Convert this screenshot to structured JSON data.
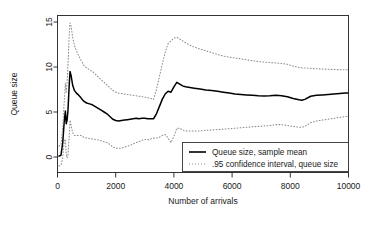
{
  "chart_data": {
    "type": "line",
    "title": "",
    "xlabel": "Number of arrivals",
    "ylabel": "Queue size",
    "xlim": [
      0,
      10000
    ],
    "ylim": [
      0,
      15
    ],
    "xticks": [
      0,
      2000,
      4000,
      6000,
      8000,
      10000
    ],
    "xtick_labels": [
      "0",
      "2000",
      "4000",
      "6000",
      "8000",
      "10000"
    ],
    "yticks": [
      0,
      5,
      10,
      15
    ],
    "ytick_labels": [
      "0",
      "5",
      "10",
      "15"
    ],
    "grid": false,
    "legend_position": "bottom-right",
    "x": [
      50,
      120,
      180,
      230,
      270,
      300,
      330,
      360,
      400,
      430,
      470,
      520,
      580,
      650,
      720,
      800,
      900,
      1000,
      1100,
      1200,
      1300,
      1400,
      1500,
      1600,
      1700,
      1800,
      1900,
      2000,
      2100,
      2200,
      2300,
      2400,
      2500,
      2600,
      2700,
      2800,
      2900,
      3000,
      3100,
      3200,
      3300,
      3400,
      3500,
      3600,
      3700,
      3800,
      3900,
      4000,
      4100,
      4200,
      4300,
      4400,
      4500,
      4700,
      4900,
      5100,
      5300,
      5500,
      5700,
      5900,
      6100,
      6300,
      6500,
      6700,
      6900,
      7100,
      7300,
      7500,
      7700,
      7900,
      8100,
      8300,
      8400,
      8500,
      8700,
      8900,
      9100,
      9300,
      9500,
      9700,
      9900,
      10000
    ],
    "series": [
      {
        "name": "Queue size, sample mean",
        "style": "solid",
        "color": "#000000",
        "values": [
          0.1,
          0.2,
          1.6,
          3.9,
          5.1,
          3.7,
          4.1,
          5.2,
          7.8,
          9.5,
          9.0,
          8.0,
          7.4,
          7.1,
          6.9,
          6.6,
          6.2,
          6.0,
          5.9,
          5.8,
          5.6,
          5.4,
          5.2,
          5.0,
          4.8,
          4.5,
          4.2,
          4.05,
          4.0,
          4.05,
          4.1,
          4.15,
          4.2,
          4.25,
          4.3,
          4.25,
          4.3,
          4.3,
          4.25,
          4.25,
          4.25,
          4.8,
          5.6,
          6.4,
          7.0,
          7.3,
          7.2,
          7.8,
          8.3,
          8.1,
          7.9,
          7.8,
          7.75,
          7.65,
          7.55,
          7.45,
          7.4,
          7.3,
          7.2,
          7.1,
          7.0,
          6.95,
          6.9,
          6.85,
          6.8,
          6.78,
          6.8,
          6.85,
          6.8,
          6.7,
          6.5,
          6.35,
          6.3,
          6.4,
          6.75,
          6.85,
          6.9,
          6.95,
          7.0,
          7.05,
          7.1,
          7.1
        ]
      },
      {
        "name": ".95 confidence interval, queue size (upper)",
        "style": "dotted",
        "color": "#8c8c8c",
        "values": [
          1.2,
          1.4,
          3.3,
          6.1,
          8.2,
          7.1,
          8.3,
          10.2,
          13.4,
          14.9,
          14.5,
          13.3,
          12.4,
          11.8,
          11.3,
          10.8,
          10.2,
          9.9,
          9.7,
          9.5,
          9.2,
          8.9,
          8.6,
          8.3,
          8.0,
          7.7,
          7.4,
          7.2,
          7.1,
          7.05,
          7.0,
          6.95,
          6.9,
          6.85,
          6.8,
          6.75,
          6.7,
          6.65,
          6.6,
          6.5,
          6.4,
          7.5,
          8.9,
          10.3,
          11.6,
          12.6,
          12.9,
          13.2,
          13.3,
          13.1,
          12.9,
          12.7,
          12.5,
          12.2,
          12.0,
          11.8,
          11.6,
          11.4,
          11.2,
          11.1,
          11.0,
          10.9,
          10.8,
          10.7,
          10.6,
          10.55,
          10.5,
          10.45,
          10.4,
          10.3,
          10.1,
          9.95,
          9.9,
          9.9,
          9.85,
          9.8,
          9.78,
          9.75,
          9.72,
          9.7,
          9.7,
          9.7
        ]
      },
      {
        "name": ".95 confidence interval, queue size (lower)",
        "style": "dotted",
        "color": "#8c8c8c",
        "values": [
          -1.0,
          -0.9,
          -0.1,
          1.7,
          2.0,
          0.3,
          -0.1,
          0.2,
          2.2,
          4.1,
          3.5,
          2.7,
          2.4,
          2.4,
          2.4,
          2.4,
          2.2,
          2.1,
          2.05,
          2.0,
          1.95,
          1.9,
          1.8,
          1.7,
          1.6,
          1.4,
          1.1,
          1.0,
          0.95,
          1.0,
          1.1,
          1.2,
          1.3,
          1.45,
          1.6,
          1.7,
          1.85,
          1.95,
          1.9,
          2.0,
          2.1,
          2.1,
          2.2,
          2.4,
          2.5,
          2.1,
          1.6,
          2.3,
          3.2,
          3.2,
          3.0,
          2.9,
          2.9,
          2.9,
          2.9,
          2.95,
          3.0,
          3.05,
          3.1,
          3.15,
          3.2,
          3.25,
          3.3,
          3.35,
          3.4,
          3.45,
          3.5,
          3.6,
          3.6,
          3.5,
          3.4,
          3.3,
          3.3,
          3.4,
          3.8,
          4.0,
          4.1,
          4.2,
          4.3,
          4.4,
          4.5,
          4.5
        ]
      }
    ],
    "legend": [
      {
        "label": "Queue size, sample mean",
        "style": "solid",
        "color": "#000000"
      },
      {
        "label": ".95 confidence interval, queue size",
        "style": "dotted",
        "color": "#8c8c8c"
      }
    ]
  },
  "colors": {
    "background": "#ffffff",
    "axis": "#333333",
    "mean_line": "#000000",
    "ci_line": "#8c8c8c",
    "text": "#1a1a1a"
  }
}
